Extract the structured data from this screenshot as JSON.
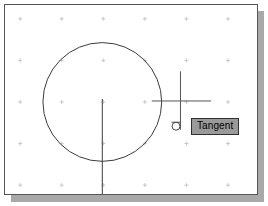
{
  "app": {
    "name": "cad-drawing-area",
    "type": "2D CAD drafting viewport"
  },
  "canvas": {
    "background_color": "#ffffff",
    "border_color": "#555555",
    "shadow_color": "#a9a9a9",
    "geometry_color": "#3a3a3a",
    "grid_color": "#c8c8c8",
    "width": 254,
    "height": 191
  },
  "grid": {
    "visible": true,
    "marker": "cross-dot",
    "origin_x": 15,
    "origin_y": 14,
    "spacing_x": 42,
    "spacing_y": 42,
    "cols": 6,
    "rows": 5
  },
  "entities": {
    "circle": {
      "name": "circle",
      "center_x": 98,
      "center_y": 98,
      "radius": 60,
      "color": "#3a3a3a"
    },
    "center_line_vertical": {
      "name": "construction-line-vertical",
      "x": 98,
      "y_start": 95,
      "y_end": 191,
      "color": "#3a3a3a"
    }
  },
  "cursor": {
    "name": "crosshair-cursor",
    "center_x": 177,
    "center_y": 97,
    "h_start_x": 148,
    "h_end_x": 208,
    "v_start_y": 67,
    "v_end_y": 126,
    "color": "#555555"
  },
  "osnap": {
    "marker_name": "tangent-snap-marker",
    "marker_x": 172,
    "marker_y": 121,
    "marker_size": 9,
    "color": "#4a4a4a"
  },
  "tooltip": {
    "label": "Tangent",
    "background_color": "#9a9a9a",
    "border_color": "#303030",
    "text_color": "#000000",
    "x": 186,
    "y": 113
  }
}
